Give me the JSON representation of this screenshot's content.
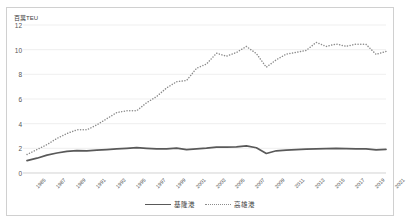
{
  "chart_data": {
    "type": "line",
    "title": "",
    "subtitle": "",
    "xlabel": "",
    "ylabel": "百萬TEU",
    "ylim": [
      0,
      12
    ],
    "yticks": [
      0,
      2,
      4,
      6,
      8,
      10,
      12
    ],
    "grid": true,
    "legend_position": "bottom-center",
    "x": [
      1985,
      1986,
      1987,
      1988,
      1989,
      1990,
      1991,
      1992,
      1993,
      1994,
      1995,
      1996,
      1997,
      1998,
      1999,
      2000,
      2001,
      2002,
      2003,
      2004,
      2005,
      2006,
      2007,
      2008,
      2009,
      2010,
      2011,
      2012,
      2013,
      2014,
      2015,
      2016,
      2017,
      2018,
      2019,
      2020,
      2021
    ],
    "xtick_labels": [
      "1985",
      "1987",
      "1989",
      "1991",
      "1993",
      "1995",
      "1997",
      "1999",
      "2001",
      "2003",
      "2005",
      "2007",
      "2009",
      "2011",
      "2013",
      "2015",
      "2017",
      "2019",
      "2021"
    ],
    "series": [
      {
        "name": "基隆港",
        "style": "solid",
        "color": "#595959",
        "values": [
          1.0,
          1.2,
          1.45,
          1.62,
          1.75,
          1.82,
          1.8,
          1.85,
          1.9,
          1.95,
          2.0,
          2.05,
          2.0,
          1.95,
          1.96,
          2.02,
          1.9,
          1.95,
          2.01,
          2.1,
          2.09,
          2.12,
          2.2,
          2.05,
          1.58,
          1.8,
          1.85,
          1.9,
          1.93,
          1.95,
          1.98,
          2.0,
          1.98,
          1.96,
          1.95,
          1.88,
          1.92
        ]
      },
      {
        "name": "高雄港",
        "style": "dotted",
        "color": "#8c8c8c",
        "values": [
          1.5,
          1.9,
          2.3,
          2.8,
          3.2,
          3.5,
          3.5,
          3.9,
          4.4,
          4.9,
          5.05,
          5.05,
          5.7,
          6.2,
          6.9,
          7.4,
          7.5,
          8.49,
          8.84,
          9.71,
          9.47,
          9.77,
          10.26,
          9.68,
          8.58,
          9.18,
          9.64,
          9.78,
          9.94,
          10.59,
          10.26,
          10.46,
          10.27,
          10.45,
          10.43,
          9.62,
          9.86
        ]
      }
    ]
  },
  "legend": {
    "items": [
      {
        "label": "基隆港",
        "style": "solid"
      },
      {
        "label": "高雄港",
        "style": "dotted"
      }
    ]
  }
}
